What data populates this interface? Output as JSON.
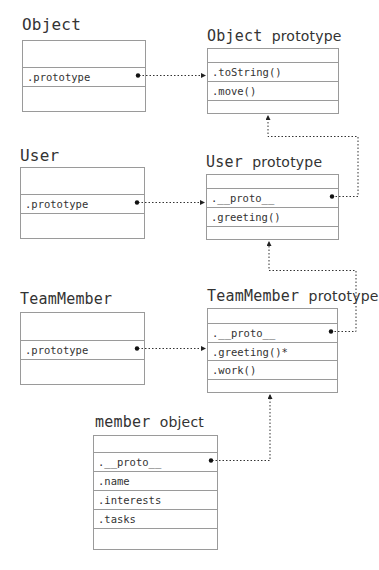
{
  "diagram": {
    "type": "prototype-chain",
    "nodes": [
      {
        "id": "object",
        "title_mono": "Object",
        "title_sans": "",
        "rows": [
          "",
          ".prototype",
          ""
        ]
      },
      {
        "id": "object_prototype",
        "title_mono": "Object",
        "title_sans": "prototype",
        "rows": [
          "",
          ".toString()",
          ".move()",
          ""
        ]
      },
      {
        "id": "user",
        "title_mono": "User",
        "title_sans": "",
        "rows": [
          "",
          ".prototype",
          ""
        ]
      },
      {
        "id": "user_prototype",
        "title_mono": "User",
        "title_sans": "prototype",
        "rows": [
          "",
          ".__proto__",
          ".greeting()",
          ""
        ]
      },
      {
        "id": "teammember",
        "title_mono": "TeamMember",
        "title_sans": "",
        "rows": [
          "",
          ".prototype",
          ""
        ]
      },
      {
        "id": "teammember_prototype",
        "title_mono": "TeamMember",
        "title_sans": "prototype",
        "rows": [
          "",
          ".__proto__",
          ".greeting()*",
          ".work()",
          ""
        ]
      },
      {
        "id": "member_object",
        "title_mono": "member",
        "title_sans": "object",
        "rows": [
          "",
          ".__proto__",
          ".name",
          ".interests",
          ".tasks",
          ""
        ]
      }
    ],
    "edges": [
      {
        "from": "object.prototype",
        "to": "object_prototype",
        "style": "dotted-arrow"
      },
      {
        "from": "user.prototype",
        "to": "user_prototype",
        "style": "dotted-arrow"
      },
      {
        "from": "teammember.prototype",
        "to": "teammember_prototype",
        "style": "dotted-arrow"
      },
      {
        "from": "user_prototype.__proto__",
        "to": "object_prototype",
        "style": "dotted-arrow"
      },
      {
        "from": "teammember_prototype.__proto__",
        "to": "user_prototype",
        "style": "dotted-arrow"
      },
      {
        "from": "member_object.__proto__",
        "to": "teammember_prototype",
        "style": "dotted-arrow"
      }
    ]
  }
}
